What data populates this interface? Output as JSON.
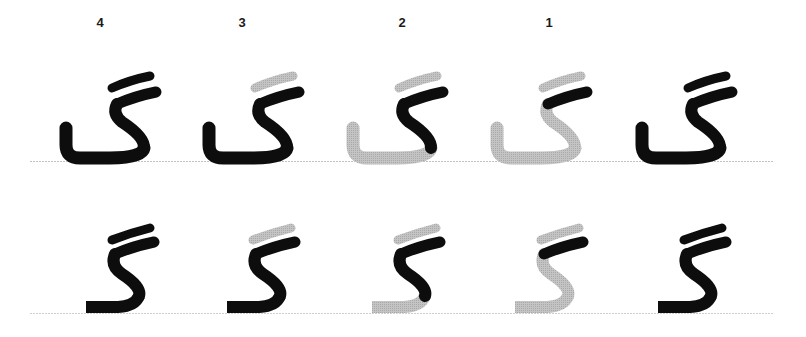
{
  "colors": {
    "ink": "#0d0d0d",
    "pending": "#bdbdbd",
    "baseline": "#bfbfbf",
    "label": "#1a1a1a"
  },
  "step_labels": [
    {
      "text": "4",
      "x": 100
    },
    {
      "text": "3",
      "x": 242
    },
    {
      "text": "2",
      "x": 402
    },
    {
      "text": "1",
      "x": 549
    }
  ],
  "rows": [
    {
      "name": "isolated-form",
      "glyph": "گ",
      "baseline_y": 161,
      "columns": [
        {
          "step": "4",
          "offset_x": 0,
          "strokes_done": [
            "bar-top",
            "bar-main",
            "body"
          ]
        },
        {
          "step": "3",
          "offset_x": 143,
          "strokes_done": [
            "bar-main",
            "body"
          ],
          "pending": [
            "bar-top"
          ]
        },
        {
          "step": "2",
          "offset_x": 287,
          "strokes_done": [
            "bar-main",
            "stem"
          ],
          "pending": [
            "bar-top",
            "bowl"
          ]
        },
        {
          "step": "1",
          "offset_x": 431,
          "strokes_done": [
            "bar-main"
          ],
          "pending": [
            "bar-top",
            "stem",
            "bowl"
          ]
        },
        {
          "step": "",
          "offset_x": 576,
          "strokes_done": [
            "bar-top",
            "bar-main",
            "body"
          ],
          "label": "final"
        }
      ]
    },
    {
      "name": "initial-form",
      "glyph": "گـ",
      "baseline_y": 313,
      "columns": [
        {
          "step": "4",
          "offset_x": 0,
          "strokes_done": [
            "bar-top",
            "bar-main",
            "body"
          ]
        },
        {
          "step": "3",
          "offset_x": 141,
          "strokes_done": [
            "bar-main",
            "body"
          ],
          "pending": [
            "bar-top"
          ]
        },
        {
          "step": "2",
          "offset_x": 286,
          "strokes_done": [
            "bar-main",
            "stem"
          ],
          "pending": [
            "bar-top",
            "tail"
          ]
        },
        {
          "step": "1",
          "offset_x": 429,
          "strokes_done": [
            "bar-main"
          ],
          "pending": [
            "bar-top",
            "stem",
            "tail"
          ]
        },
        {
          "step": "",
          "offset_x": 572,
          "strokes_done": [
            "bar-top",
            "bar-main",
            "body"
          ],
          "label": "final"
        }
      ]
    }
  ]
}
